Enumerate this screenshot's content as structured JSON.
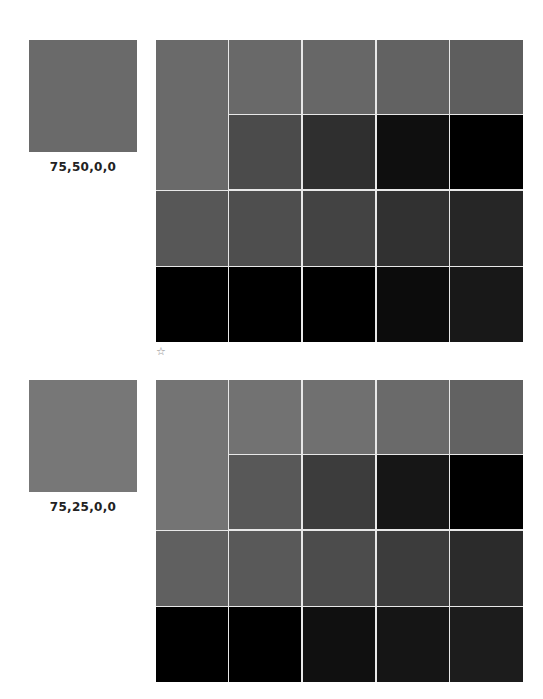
{
  "sections": [
    {
      "swatch": {
        "label": "75,50,0,0",
        "color": "#6a6a6a"
      },
      "grid": {
        "tall_cell": "#6a6a6a",
        "row1": [
          "#696969",
          "#676767",
          "#626262",
          "#5e5e5e"
        ],
        "row2": [
          "#4b4b4b",
          "#2f2f2f",
          "#0f0f0f",
          "#000000"
        ],
        "row3": [
          "#575757",
          "#4e4e4e",
          "#434343",
          "#313131",
          "#262626"
        ],
        "row4": [
          "#000000",
          "#000000",
          "#000000",
          "#0c0c0c",
          "#181818"
        ]
      },
      "marker": "☆"
    },
    {
      "swatch": {
        "label": "75,25,0,0",
        "color": "#777777"
      },
      "grid": {
        "tall_cell": "#747474",
        "row1": [
          "#727272",
          "#707070",
          "#6a6a6a",
          "#626262"
        ],
        "row2": [
          "#585858",
          "#3c3c3c",
          "#161616",
          "#000000"
        ],
        "row3": [
          "#606060",
          "#595959",
          "#4c4c4c",
          "#3c3c3c",
          "#2b2b2b"
        ],
        "row4": [
          "#000000",
          "#000000",
          "#101010",
          "#151515",
          "#1c1c1c"
        ]
      }
    }
  ]
}
